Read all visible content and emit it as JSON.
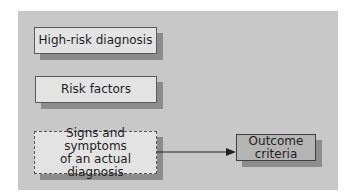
{
  "diagram": {
    "boxes": [
      {
        "id": "high-risk",
        "label": "High-risk diagnosis",
        "style": "solid"
      },
      {
        "id": "risk-factors",
        "label": "Risk factors",
        "style": "solid"
      },
      {
        "id": "signs-symptoms",
        "label_line1": "Signs and symptoms",
        "label_line2": "of an actual diagnosis",
        "style": "dashed"
      },
      {
        "id": "outcome",
        "label": "Outcome criteria",
        "style": "solid-dark"
      }
    ],
    "edges": [
      {
        "from": "signs-symptoms",
        "to": "outcome",
        "type": "arrow"
      }
    ],
    "colors": {
      "panel": "#c8c8c8",
      "box_fill": "#e3e3e3",
      "outcome_fill": "#b4b4b4",
      "shadow": "#8c8c8c",
      "border": "#5a5a5a"
    }
  }
}
